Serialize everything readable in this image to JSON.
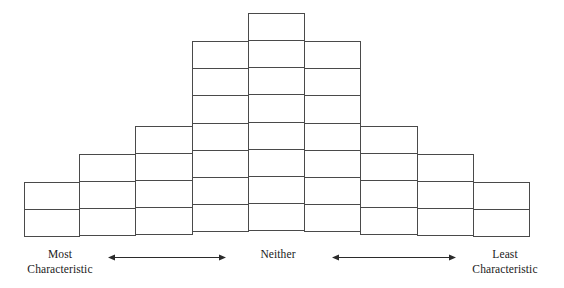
{
  "figure": {
    "name": "q-sort-distribution-grid",
    "background_color": "#ffffff",
    "line_color": "#4a4a4a",
    "text_color": "#1a1a1a"
  },
  "labels": {
    "most": {
      "line1": "Most",
      "line2": "Characteristic"
    },
    "neither": {
      "line1": "Neither",
      "line2": ""
    },
    "least": {
      "line1": "Least",
      "line2": "Characteristic"
    }
  },
  "arrows": {
    "left": {
      "name": "double-headed-arrow-left",
      "direction": "both"
    },
    "right": {
      "name": "double-headed-arrow-right",
      "direction": "both"
    }
  },
  "chart_data": {
    "type": "bar",
    "title": "",
    "subtitle": "",
    "xlabel": "",
    "ylabel": "",
    "categories": [
      "1",
      "2",
      "3",
      "4",
      "5",
      "6",
      "7",
      "8",
      "9"
    ],
    "values": [
      2,
      3,
      4,
      7,
      8,
      7,
      4,
      3,
      2
    ],
    "ylim": [
      0,
      8
    ],
    "grid": true,
    "legend": "none",
    "total_cells": 40,
    "columns": 9,
    "max_rows": 8,
    "axis_annotations": [
      {
        "position": "left",
        "text": "Most Characteristic"
      },
      {
        "position": "center",
        "text": "Neither"
      },
      {
        "position": "right",
        "text": "Least Characteristic"
      }
    ]
  }
}
